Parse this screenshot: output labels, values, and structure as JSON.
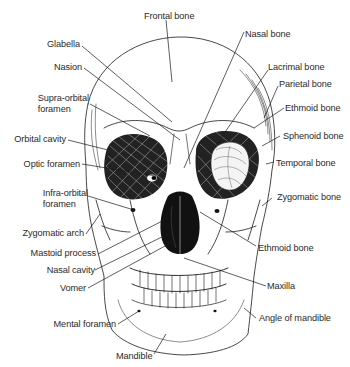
{
  "diagram": {
    "labels_left": [
      {
        "id": "glabella",
        "text": "Glabella"
      },
      {
        "id": "nasion",
        "text": "Nasion"
      },
      {
        "id": "supra-orbital-foramen",
        "text": "Supra-orbital foramen",
        "line1": "Supra-orbital",
        "line2": "foramen"
      },
      {
        "id": "orbital-cavity",
        "text": "Orbital cavity"
      },
      {
        "id": "optic-foramen",
        "text": "Optic foramen"
      },
      {
        "id": "infra-orbital-foramen",
        "text": "Infra-orbital foramen",
        "line1": "Infra-orbital",
        "line2": "foramen"
      },
      {
        "id": "zygomatic-arch",
        "text": "Zygomatic arch"
      },
      {
        "id": "mastoid-process",
        "text": "Mastoid process"
      },
      {
        "id": "nasal-cavity",
        "text": "Nasal cavity"
      },
      {
        "id": "vomer",
        "text": "Vomer"
      },
      {
        "id": "mental-foramen",
        "text": "Mental foramen"
      },
      {
        "id": "mandible",
        "text": "Mandible"
      }
    ],
    "labels_top": [
      {
        "id": "frontal-bone",
        "text": "Frontal bone"
      }
    ],
    "labels_right": [
      {
        "id": "nasal-bone",
        "text": "Nasal bone"
      },
      {
        "id": "lacrimal-bone",
        "text": "Lacrimal bone"
      },
      {
        "id": "parietal-bone",
        "text": "Parietal bone"
      },
      {
        "id": "ethmoid-bone-upper",
        "text": "Ethmoid bone"
      },
      {
        "id": "sphenoid-bone",
        "text": "Sphenoid bone"
      },
      {
        "id": "temporal-bone",
        "text": "Temporal bone"
      },
      {
        "id": "zygomatic-bone",
        "text": "Zygomatic bone"
      },
      {
        "id": "ethmoid-bone-lower",
        "text": "Ethmoid bone"
      },
      {
        "id": "maxilla",
        "text": "Maxilla"
      },
      {
        "id": "angle-of-mandible",
        "text": "Angle of mandible"
      }
    ],
    "colors": {
      "background": "#ffffff",
      "ink": "#1a1a1a",
      "label_text": "#2a2a2a"
    }
  }
}
